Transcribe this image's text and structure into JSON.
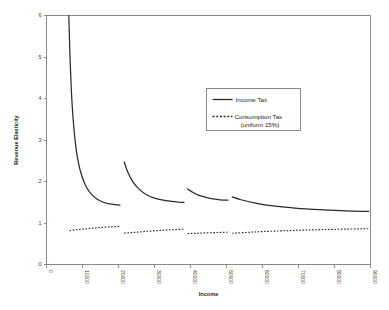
{
  "chart_data": {
    "type": "line",
    "title": "",
    "xlabel": "Income",
    "ylabel": "Revenue Elasticity",
    "xlim": [
      0,
      90000
    ],
    "ylim": [
      0,
      6
    ],
    "grid": false,
    "legend_position": "upper-right-inside",
    "x_ticks": [
      0,
      10000,
      20000,
      30000,
      40000,
      50000,
      60000,
      70000,
      80000,
      90000
    ],
    "x_tick_labels": [
      "0",
      "10000",
      "20000",
      "30000",
      "40000",
      "50000",
      "60000",
      "70000",
      "80000",
      "90000"
    ],
    "y_ticks": [
      0,
      1,
      2,
      3,
      4,
      5,
      6
    ],
    "y_tick_labels": [
      "0",
      "1",
      "2",
      "3",
      "4",
      "5",
      "6"
    ],
    "series": [
      {
        "name": "Income Tax",
        "style": "solid",
        "color": "#2b2b2b",
        "segments": [
          {
            "x": [
              6200,
              6500,
              6900,
              7400,
              8000,
              8800,
              9800,
              11000,
              12400,
              14000,
              15800,
              17600,
              19200,
              20400
            ],
            "y": [
              6.0,
              5.1,
              4.2,
              3.5,
              2.95,
              2.48,
              2.14,
              1.88,
              1.7,
              1.58,
              1.5,
              1.46,
              1.44,
              1.43
            ]
          },
          {
            "x": [
              21600,
              22600,
              24000,
              25800,
              27800,
              30000,
              32400,
              34800,
              36800,
              38200
            ],
            "y": [
              2.47,
              2.22,
              1.99,
              1.81,
              1.68,
              1.6,
              1.55,
              1.52,
              1.5,
              1.5
            ]
          },
          {
            "x": [
              39200,
              40400,
              42200,
              44200,
              46200,
              48200,
              49600,
              50400
            ],
            "y": [
              1.82,
              1.75,
              1.67,
              1.62,
              1.58,
              1.56,
              1.55,
              1.55
            ]
          },
          {
            "x": [
              51600,
              54000,
              58000,
              63000,
              69000,
              76000,
              83000,
              89500
            ],
            "y": [
              1.63,
              1.56,
              1.48,
              1.41,
              1.36,
              1.32,
              1.29,
              1.28
            ]
          }
        ]
      },
      {
        "name": "Consumption Tax (uniform 15%)",
        "style": "dotted",
        "color": "#2b2b2b",
        "segments": [
          {
            "x": [
              6400,
              8500,
              11000,
              13500,
              16000,
              18500,
              20400
            ],
            "y": [
              0.82,
              0.84,
              0.86,
              0.88,
              0.9,
              0.91,
              0.92
            ]
          },
          {
            "x": [
              21600,
              24500,
              28000,
              31500,
              35000,
              38200
            ],
            "y": [
              0.755,
              0.775,
              0.8,
              0.82,
              0.84,
              0.85
            ]
          },
          {
            "x": [
              39200,
              42000,
              45000,
              48000,
              50400
            ],
            "y": [
              0.745,
              0.755,
              0.765,
              0.772,
              0.778
            ]
          },
          {
            "x": [
              51600,
              58000,
              65000,
              72000,
              80000,
              89500
            ],
            "y": [
              0.752,
              0.785,
              0.81,
              0.83,
              0.848,
              0.862
            ]
          }
        ]
      }
    ],
    "legend": [
      {
        "label": "Income Tax",
        "style": "solid"
      },
      {
        "label": "Consumption Tax",
        "sublabel": "(uniform 15%)",
        "style": "dotted"
      }
    ]
  },
  "axis_titles": {
    "x": "Income",
    "y": "Revenue Elasticity"
  }
}
